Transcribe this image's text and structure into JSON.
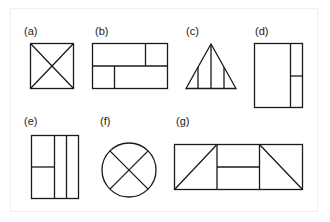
{
  "figure": {
    "panels": [
      {
        "id": "a",
        "label": "(a)",
        "shape": "square with both diagonals"
      },
      {
        "id": "b",
        "label": "(b)",
        "shape": "rectangle split horizontally, each half split vertically at different points"
      },
      {
        "id": "c",
        "label": "(c)",
        "shape": "triangle with three vertical lines"
      },
      {
        "id": "d",
        "label": "(d)",
        "shape": "tall rectangle with right column split horizontally"
      },
      {
        "id": "e",
        "label": "(e)",
        "shape": "tall rectangle with two vertical columns and left part split horizontally"
      },
      {
        "id": "f",
        "label": "(f)",
        "shape": "circle with X"
      },
      {
        "id": "g",
        "label": "(g)",
        "shape": "wide rectangle in three parts: diagonal, horizontal split, diagonal"
      }
    ]
  }
}
